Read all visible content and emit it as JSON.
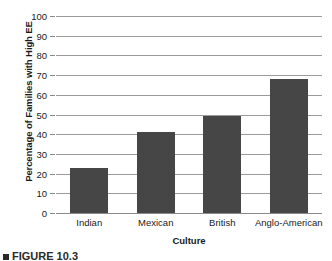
{
  "chart_data": {
    "type": "bar",
    "title": "",
    "categories": [
      "Indian",
      "Mexican",
      "British",
      "Anglo-American"
    ],
    "values": [
      23,
      41,
      49,
      68
    ],
    "series": [
      {
        "name": "Percentage of Families with High EE",
        "values": [
          23,
          41,
          49,
          68
        ]
      }
    ],
    "xlabel": "Culture",
    "ylabel": "Percentage of Families with High EE",
    "ylim": [
      0,
      100
    ],
    "ytick_labels": [
      "0",
      "10",
      "20",
      "30",
      "40",
      "50",
      "60",
      "70",
      "80",
      "90",
      "100"
    ],
    "ytick_values": [
      0,
      10,
      20,
      30,
      40,
      50,
      60,
      70,
      80,
      90,
      100
    ],
    "grid": true,
    "legend": "none",
    "bar_color": "#464646",
    "gridline_color": "#9b9b9b",
    "background_color": "#ffffff"
  },
  "caption": {
    "text": "FIGURE 10.3"
  }
}
